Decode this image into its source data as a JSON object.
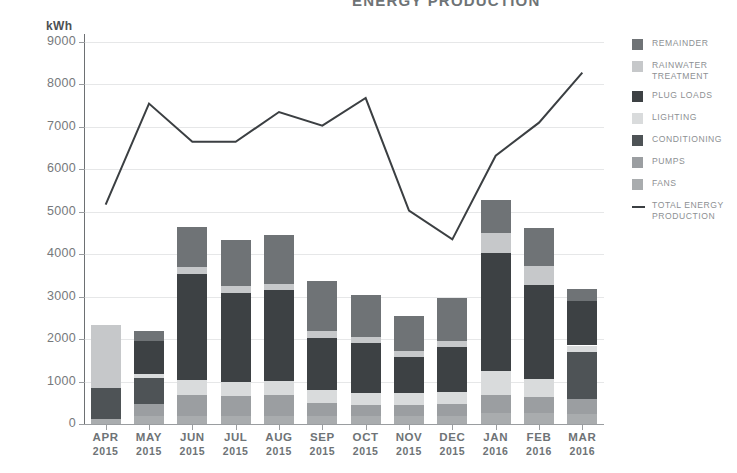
{
  "chart_data": {
    "type": "bar",
    "title": "ENERGY PRODUCTION",
    "ylabel": "kWh",
    "xlabel": "",
    "ylim": [
      0,
      9000
    ],
    "yticks": [
      0,
      1000,
      2000,
      3000,
      4000,
      5000,
      6000,
      7000,
      8000,
      9000
    ],
    "grid": true,
    "legend_position": "right",
    "stacked": true,
    "categories": [
      "APR",
      "MAY",
      "JUN",
      "JUL",
      "AUG",
      "SEP",
      "OCT",
      "NOV",
      "DEC",
      "JAN",
      "FEB",
      "MAR"
    ],
    "category_years": [
      "2015",
      "2015",
      "2015",
      "2015",
      "2015",
      "2015",
      "2015",
      "2015",
      "2015",
      "2016",
      "2016",
      "2016"
    ],
    "series": [
      {
        "name": "FANS",
        "color": "#a9acae",
        "values": [
          110,
          180,
          200,
          190,
          200,
          190,
          180,
          180,
          190,
          260,
          250,
          230
        ]
      },
      {
        "name": "PUMPS",
        "color": "#9b9ea1",
        "values": [
          0,
          290,
          480,
          470,
          480,
          300,
          270,
          260,
          280,
          420,
          380,
          350
        ]
      },
      {
        "name": "CONDITIONING",
        "color": "#4e5356",
        "values": [
          740,
          610,
          0,
          0,
          0,
          0,
          0,
          0,
          0,
          0,
          0,
          1120
        ]
      },
      {
        "name": "LIGHTING",
        "color": "#d9dbdc",
        "values": [
          0,
          90,
          350,
          330,
          340,
          300,
          280,
          280,
          280,
          560,
          420,
          150
        ]
      },
      {
        "name": "PLUG LOADS",
        "color": "#3d4144",
        "values": [
          0,
          790,
          2500,
          2100,
          2130,
          1240,
          1170,
          860,
          1070,
          2800,
          2230,
          1050
        ]
      },
      {
        "name": "RAINWATER TREATMENT",
        "color": "#c6c8ca",
        "values": [
          1490,
          0,
          160,
          160,
          150,
          150,
          150,
          140,
          140,
          450,
          450,
          0
        ]
      },
      {
        "name": "REMAINDER",
        "color": "#6f7376",
        "values": [
          0,
          220,
          960,
          1090,
          1150,
          1180,
          1000,
          830,
          1000,
          790,
          900,
          280
        ]
      }
    ],
    "bar_totals": [
      2340,
      2180,
      4650,
      4340,
      4450,
      3360,
      3050,
      2550,
      2960,
      5280,
      4630,
      3180
    ],
    "line": {
      "name": "TOTAL ENERGY PRODUCTION",
      "color": "#3b3f42",
      "values": [
        5170,
        7550,
        6650,
        6650,
        7350,
        7030,
        7680,
        5030,
        4350,
        6320,
        7100,
        8280
      ]
    }
  },
  "legend": {
    "items": [
      {
        "label": "REMAINDER",
        "color": "#6f7376",
        "type": "swatch"
      },
      {
        "label": "RAINWATER TREATMENT",
        "color": "#c6c8ca",
        "type": "swatch"
      },
      {
        "label": "PLUG LOADS",
        "color": "#3d4144",
        "type": "swatch"
      },
      {
        "label": "LIGHTING",
        "color": "#d9dbdc",
        "type": "swatch"
      },
      {
        "label": "CONDITIONING",
        "color": "#4e5356",
        "type": "swatch"
      },
      {
        "label": "PUMPS",
        "color": "#9b9ea1",
        "type": "swatch"
      },
      {
        "label": "FANS",
        "color": "#a9acae",
        "type": "swatch"
      },
      {
        "label": "TOTAL ENERGY PRODUCTION",
        "color": "#3b3f42",
        "type": "line"
      }
    ]
  }
}
